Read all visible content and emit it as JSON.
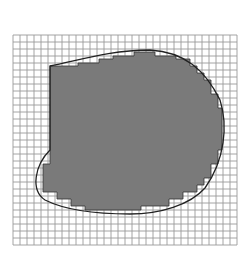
{
  "figure": {
    "grid": {
      "x0": 13,
      "y0": 35,
      "cell": 7,
      "cols": 32,
      "rows": 30,
      "line_color": "#9a9a9a"
    },
    "colors": {
      "shade": "#7a7a7a",
      "outline": "#222222",
      "background": "#ffffff"
    },
    "curve_path": "M50,66 C80,60 110,50 150,50 C185,52 205,70 220,100 C228,125 225,160 205,188 C190,205 160,214 130,214 C95,214 65,210 45,200 C30,190 35,165 50,150 Z",
    "staircase_points": "50,66 78,66 78,63 99,63 99,59 113,59 113,56 134,56 134,52 155,52 155,56 176,56 176,59 190,59 190,66 197,66 197,73 204,73 204,80 211,80 211,94 218,94 218,108 222,108 222,150 218,150 218,164 211,164 211,178 204,178 204,185 197,185 197,192 183,192 183,199 169,199 169,206 141,206 141,210 85,210 85,206 71,206 71,199 57,199 57,192 43,192 43,164 50,164 50,150"
  }
}
